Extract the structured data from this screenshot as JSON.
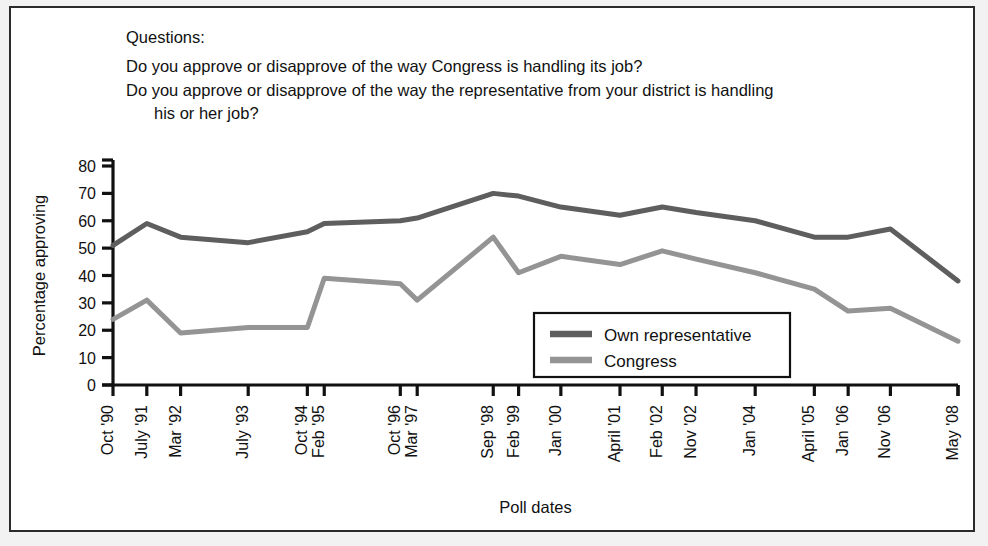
{
  "questions": {
    "heading": "Questions:",
    "line1": "Do you approve or disapprove of the way Congress is handling its job?",
    "line2": "Do you approve or disapprove of the way the representative from your district is handling",
    "line3": "his or her job?"
  },
  "chart_data": {
    "type": "line",
    "title": "",
    "xlabel": "Poll dates",
    "ylabel": "Percentage approving",
    "ylim": [
      0,
      80
    ],
    "ytick_step": 10,
    "yticks": [
      "0",
      "10",
      "20",
      "30",
      "40",
      "50",
      "60",
      "70",
      "80"
    ],
    "grid": false,
    "legend_position": "inside-lower-right",
    "categories": [
      "Oct '90",
      "July '91",
      "Mar '92",
      "July '93",
      "Oct '94",
      "Feb '95",
      "Oct '96",
      "Mar '97",
      "Sep '98",
      "Feb '99",
      "Jan '00",
      "April '01",
      "Feb '02",
      "Nov '02",
      "Jan '04",
      "April '05",
      "Jan '06",
      "Nov '06",
      "May '08"
    ],
    "x_positions": [
      0,
      4,
      8,
      16,
      23,
      25,
      34,
      36,
      45,
      48,
      53,
      60,
      65,
      69,
      76,
      83,
      87,
      92,
      100
    ],
    "series": [
      {
        "name": "Own representative",
        "color": "#5e5e5e",
        "values": [
          51,
          59,
          54,
          52,
          56,
          59,
          60,
          61,
          70,
          69,
          65,
          62,
          65,
          63,
          60,
          54,
          54,
          57,
          38
        ]
      },
      {
        "name": "Congress",
        "color": "#949494",
        "values": [
          24,
          31,
          19,
          21,
          21,
          39,
          37,
          31,
          54,
          41,
          47,
          44,
          49,
          46,
          37,
          41,
          35,
          27,
          28
        ]
      }
    ],
    "series_overrides": {
      "congress_tail": [
        41,
        35,
        27,
        28,
        16
      ]
    }
  },
  "legend": {
    "items": [
      {
        "label": "Own representative",
        "color": "#5e5e5e"
      },
      {
        "label": "Congress",
        "color": "#949494"
      }
    ]
  },
  "colors": {
    "own_representative": "#5e5e5e",
    "congress": "#949494",
    "axis": "#111111",
    "frame": "#2b2b2b",
    "page_background": "#f2f2f2",
    "figure_background": "#ffffff"
  }
}
